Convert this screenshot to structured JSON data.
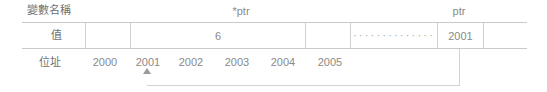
{
  "figure": {
    "type": "memory-layout-diagram",
    "row_labels": {
      "variable_name": "變數名稱",
      "value": "值",
      "address": "位址"
    },
    "variable_names": [
      {
        "label": "*ptr",
        "center_x": 241
      },
      {
        "label": "ptr",
        "center_x": 459
      }
    ],
    "value_cells": [
      {
        "text": "",
        "left": 85,
        "right": 130
      },
      {
        "text": "6",
        "left": 130,
        "right": 305
      },
      {
        "text": "",
        "left": 305,
        "right": 350
      },
      {
        "text": "dots",
        "left": 350,
        "right": 437,
        "dots": "··············"
      },
      {
        "text": "2001",
        "left": 437,
        "right": 483
      },
      {
        "text": "",
        "left": 483,
        "right": 527
      }
    ],
    "addresses": [
      {
        "label": "2000",
        "center_x": 105
      },
      {
        "label": "2001",
        "center_x": 147
      },
      {
        "label": "2002",
        "center_x": 190
      },
      {
        "label": "2003",
        "center_x": 237
      },
      {
        "label": "2004",
        "center_x": 283
      },
      {
        "label": "2005",
        "center_x": 330
      }
    ],
    "pointer_link": {
      "from_cell_value": "2001",
      "to_address": "2001",
      "marker": "arrow-up"
    },
    "colors": {
      "text": "#8a8a8a",
      "cjk_text": "#6f6f6f",
      "rule": "#c9c9c9",
      "cell_divider": "#cfcfcf",
      "link": "#d2d2d2",
      "arrow": "#9a9a9a",
      "background": "#ffffff"
    }
  }
}
